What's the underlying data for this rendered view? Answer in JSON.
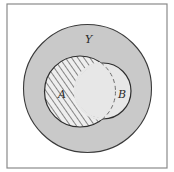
{
  "diagram": {
    "type": "venn",
    "frame": {
      "x": 7,
      "y": 4,
      "width": 160,
      "height": 164,
      "stroke": "#8a8a8a"
    },
    "universe": {
      "label": "Y",
      "cx": 87.5,
      "cy": 88.5,
      "r": 64,
      "fill": "#c9c9c9",
      "stroke": "#3a3a3a",
      "label_x": 88,
      "label_y": 42
    },
    "sets": [
      {
        "label": "A",
        "cx": 80,
        "cy": 91.5,
        "r": 35.5,
        "fill_pattern": "diagonal-hatch",
        "hatch_color": "#6a6a6a",
        "hatch_background": "#eeeeee",
        "stroke": "#2e2e2e",
        "label_x": 62,
        "label_y": 96
      },
      {
        "label": "B",
        "cx": 103,
        "cy": 91,
        "r": 28,
        "fill": "#e7e7e7",
        "stroke": "#2e2e2e",
        "label_x": 122,
        "label_y": 96
      }
    ],
    "intersection": {
      "label": "A ∩ B",
      "fill": "#e7e7e7",
      "boundary_style": "dashed"
    },
    "shaded_region": "A \\ B (hatched)"
  }
}
